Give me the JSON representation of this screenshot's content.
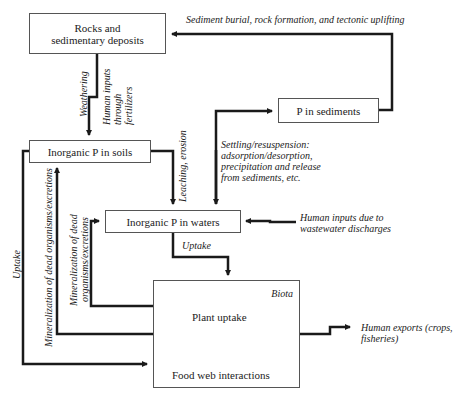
{
  "nodes": {
    "rocks": "Rocks and\nsedimentary deposits",
    "rocks_line1": "Rocks and",
    "rocks_line2": "sedimentary deposits",
    "p_sediments": "P in sediments",
    "p_soils": "Inorganic P in soils",
    "p_waters": "Inorganic P in waters",
    "biota": {
      "title": "Biota",
      "plant_uptake": "Plant uptake",
      "food_web": "Food web interactions"
    }
  },
  "flows": {
    "sediment_burial": "Sediment burial, rock formation, and tectonic uplifting",
    "weathering": "Weathering",
    "human_inputs_fert_1": "Human inputs",
    "human_inputs_fert_2": "through",
    "human_inputs_fert_3": "fertilizers",
    "leaching": "Leaching, erosion",
    "settling_1": "Settling/resuspension:",
    "settling_2": "adsorption/desorption,",
    "settling_3": "precipitation and release",
    "settling_4": "from sediments, etc.",
    "human_inputs_ww_1": "Human inputs due to",
    "human_inputs_ww_2": "wastewater discharges",
    "uptake_waters": "Uptake",
    "uptake_soils": "Uptake",
    "mineralization_soils": "Mineralization of dead organisms/excretions",
    "mineralization_waters_1": "Mineralization of dead",
    "mineralization_waters_2": "organisms/excretions",
    "human_exports_1": "Human exports (crops,",
    "human_exports_2": "fisheries)"
  },
  "colors": {
    "line": "#1a1a1a",
    "box_border": "#555555",
    "text": "#222222"
  }
}
